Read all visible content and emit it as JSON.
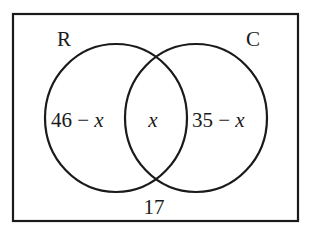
{
  "diagram": {
    "type": "venn",
    "sets": [
      {
        "name": "R",
        "only_region": "46 − x"
      },
      {
        "name": "C",
        "only_region": "35 − x"
      }
    ],
    "labels": {
      "set_left": "R",
      "set_right": "C",
      "left_only_num": "46 − ",
      "left_only_var": "x",
      "intersection": "x",
      "right_only_num": "35 − ",
      "right_only_var": "x",
      "outside": "17"
    },
    "colors": {
      "stroke": "#1a1a1a",
      "background": "#ffffff"
    }
  }
}
